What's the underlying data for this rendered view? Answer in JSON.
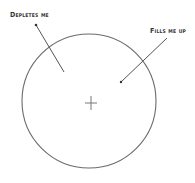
{
  "diagram": {
    "labels": {
      "depletes": "Depletes me",
      "fills": "Fills me up"
    },
    "center_marker": "+",
    "stroke_color": "#6b6b6b"
  }
}
